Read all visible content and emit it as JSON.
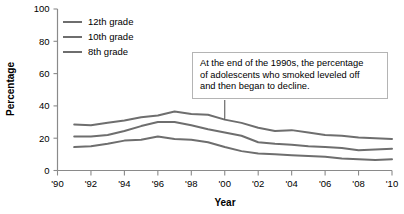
{
  "chart_data": {
    "type": "line",
    "title": "",
    "xlabel": "Year",
    "ylabel": "Percentage",
    "xlim": [
      1990,
      2010
    ],
    "ylim": [
      0,
      100
    ],
    "grid": false,
    "legend_position": "top-left",
    "x_tick_labels": [
      "'90",
      "'92",
      "'94",
      "'96",
      "'98",
      "'00",
      "'02",
      "'04",
      "'06",
      "'08",
      "'10"
    ],
    "x_tick_values": [
      1990,
      1992,
      1994,
      1996,
      1998,
      2000,
      2002,
      2004,
      2006,
      2008,
      2010
    ],
    "y_tick_labels": [
      "0",
      "20",
      "40",
      "60",
      "80",
      "100"
    ],
    "y_tick_values": [
      0,
      20,
      40,
      60,
      80,
      100
    ],
    "x": [
      1991,
      1992,
      1993,
      1994,
      1995,
      1996,
      1997,
      1998,
      1999,
      2000,
      2001,
      2002,
      2003,
      2004,
      2005,
      2006,
      2007,
      2008,
      2009,
      2010
    ],
    "series": [
      {
        "name": "12th grade",
        "values": [
          28.5,
          28.0,
          29.5,
          31.0,
          33.0,
          34.0,
          36.5,
          35.0,
          34.5,
          31.5,
          29.5,
          26.5,
          24.5,
          25.0,
          23.5,
          22.0,
          21.5,
          20.5,
          20.0,
          19.5
        ]
      },
      {
        "name": "10th grade",
        "values": [
          21.0,
          21.0,
          22.0,
          24.5,
          27.5,
          30.0,
          30.0,
          28.0,
          25.5,
          23.5,
          21.5,
          17.5,
          16.5,
          16.0,
          15.0,
          14.5,
          14.0,
          12.5,
          13.0,
          13.5
        ]
      },
      {
        "name": "8th grade",
        "values": [
          14.5,
          15.0,
          16.5,
          18.5,
          19.0,
          21.0,
          19.5,
          19.0,
          17.5,
          14.5,
          12.0,
          10.5,
          10.0,
          9.5,
          9.0,
          8.5,
          7.5,
          7.0,
          6.5,
          7.0
        ]
      }
    ],
    "annotations": [
      {
        "text": "At the end of the 1990s, the percentage of adolescents who smoked leveled off and then began to decline.",
        "points_to_year": 2000,
        "points_to_series": "12th grade"
      }
    ],
    "colors": {
      "series_line": "#6e6e6e",
      "axis": "#8a8a8a",
      "annotation_border": "#b4b4b4",
      "text": "#000000",
      "background": "#ffffff"
    }
  },
  "legend": {
    "items": [
      {
        "label": "12th grade"
      },
      {
        "label": "10th grade"
      },
      {
        "label": "8th grade"
      }
    ]
  },
  "annotation": {
    "line1": "At the end of the 1990s, the percentage",
    "line2": "of adolescents who smoked leveled off",
    "line3": "and then began to decline."
  }
}
